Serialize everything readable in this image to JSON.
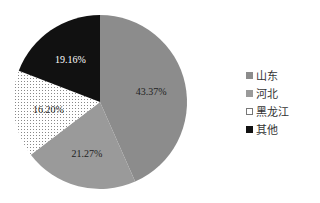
{
  "chart_data": {
    "type": "pie",
    "title": "",
    "start_angle_deg": 0,
    "direction": "clockwise",
    "legend_position": "right",
    "slices": [
      {
        "label": "山东",
        "value": 43.37,
        "text": "43.37%",
        "color": "#8c8c8c",
        "pattern": "solid"
      },
      {
        "label": "河北",
        "value": 21.27,
        "text": "21.27%",
        "color": "#9a9a9a",
        "pattern": "solid"
      },
      {
        "label": "黑龙江",
        "value": 16.2,
        "text": "16.20%",
        "color": "#f2f2f2",
        "pattern": "dots"
      },
      {
        "label": "其他",
        "value": 19.16,
        "text": "19.16%",
        "color": "#111111",
        "pattern": "solid"
      }
    ]
  }
}
